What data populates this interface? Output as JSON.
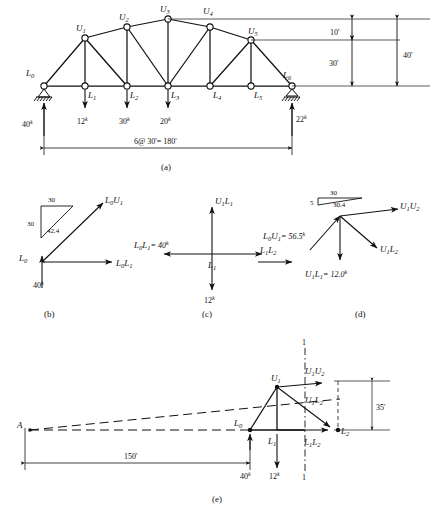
{
  "figure": {
    "title_parts": [
      "(a)",
      "(b)",
      "(c)",
      "(d)",
      "(e)"
    ],
    "line_color": "#111111"
  },
  "panel_a": {
    "caption": "(a)",
    "upper_joints": [
      {
        "name": "U",
        "sub": "1"
      },
      {
        "name": "U",
        "sub": "2"
      },
      {
        "name": "U",
        "sub": "3"
      },
      {
        "name": "U",
        "sub": "4"
      },
      {
        "name": "U",
        "sub": "5"
      }
    ],
    "lower_joints": [
      {
        "name": "L",
        "sub": "0"
      },
      {
        "name": "L",
        "sub": "1"
      },
      {
        "name": "L",
        "sub": "2"
      },
      {
        "name": "L",
        "sub": "3"
      },
      {
        "name": "L",
        "sub": "4"
      },
      {
        "name": "L",
        "sub": "5"
      },
      {
        "name": "L",
        "sub": "6"
      }
    ],
    "loads": [
      {
        "at": "L1",
        "value": "12",
        "unit": "k"
      },
      {
        "at": "L2",
        "value": "30",
        "unit": "k"
      },
      {
        "at": "L3",
        "value": "20",
        "unit": "k"
      }
    ],
    "reactions": [
      {
        "at": "L0",
        "value": "40",
        "unit": "k"
      },
      {
        "at": "L6",
        "value": "22",
        "unit": "k"
      }
    ],
    "vertical_dims": [
      {
        "label": "10'"
      },
      {
        "label": "30'"
      },
      {
        "label": "40'"
      }
    ],
    "span_dim": "6@ 30'= 180'"
  },
  "panel_b": {
    "caption": "(b)",
    "joint_label": {
      "name": "L",
      "sub": "0"
    },
    "member_up": {
      "name": "L",
      "sub": "0",
      "name2": "U",
      "sub2": "1"
    },
    "member_right": {
      "name": "L",
      "sub": "0",
      "name2": "L",
      "sub2": "1"
    },
    "reaction": "40",
    "reaction_unit": "k",
    "slope_triangle": {
      "run": "30",
      "rise": "30",
      "hyp": "42.4"
    }
  },
  "panel_c": {
    "caption": "(c)",
    "joint_label": {
      "name": "L",
      "sub": "1"
    },
    "up_member": {
      "name": "U",
      "sub": "1",
      "name2": "L",
      "sub2": "1"
    },
    "left_member_text": "= 40",
    "left_member_unit": "k",
    "left_member": {
      "name": "L",
      "sub": "0",
      "name2": "L",
      "sub2": "1"
    },
    "right_member": {
      "name": "L",
      "sub": "1",
      "name2": "L",
      "sub2": "2"
    },
    "load": "12",
    "load_unit": "k"
  },
  "panel_d": {
    "caption": "(d)",
    "slope_triangle": {
      "run": "30",
      "rise": "5",
      "hyp": "30.4"
    },
    "right_member": {
      "name": "U",
      "sub": "1",
      "name2": "U",
      "sub2": "2"
    },
    "incoming_member": {
      "name": "L",
      "sub": "0",
      "name2": "U",
      "sub2": "1"
    },
    "incoming_value": "= 56.5",
    "incoming_unit": "k",
    "left_member": {
      "name": "L",
      "sub": "1",
      "name2": "L",
      "sub2": "2"
    },
    "diag_member": {
      "name": "U",
      "sub": "1",
      "name2": "L",
      "sub2": "2"
    },
    "vert_member": {
      "name": "U",
      "sub": "1",
      "name2": "L",
      "sub2": "1"
    },
    "vert_value": "= 12.0",
    "vert_unit": "k"
  },
  "panel_e": {
    "caption": "(e)",
    "moment_center": "A",
    "distance": "150'",
    "height": "35'",
    "section_label_top": "1",
    "section_label_bottom": "1",
    "joints": [
      {
        "name": "U",
        "sub": "1"
      },
      {
        "name": "L",
        "sub": "0"
      },
      {
        "name": "L",
        "sub": "1"
      },
      {
        "name": "L",
        "sub": "2"
      }
    ],
    "members": [
      {
        "name": "U",
        "sub": "1",
        "name2": "U",
        "sub2": "2"
      },
      {
        "name": "U",
        "sub": "1",
        "name2": "L",
        "sub2": "2"
      },
      {
        "name": "L",
        "sub": "1",
        "name2": "L",
        "sub2": "2"
      }
    ],
    "reaction": "40",
    "reaction_unit": "k",
    "load": "12",
    "load_unit": "k"
  }
}
